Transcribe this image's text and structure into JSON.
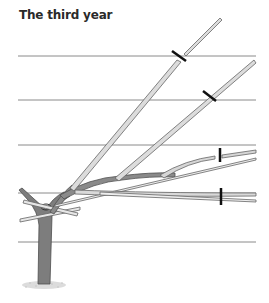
{
  "figure": {
    "title": "The third year",
    "colors": {
      "wire": "#8a8a8a",
      "wood": "#7a7a7a",
      "wood_outline": "#555555",
      "cut_mark": "#1a1a1a",
      "ground": "#bbbbbb"
    }
  }
}
